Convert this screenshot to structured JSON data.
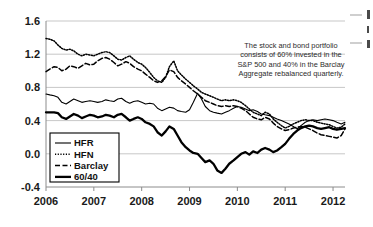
{
  "figure": {
    "title": "",
    "annotation": [
      "The stock and bond portfolio",
      "consists of 60% invested in the",
      "S&P 500 and 40% in the Barclay",
      "Aggregate rebalanced quarterly."
    ]
  },
  "chart_data": {
    "type": "line",
    "title": "",
    "xlabel": "",
    "ylabel": "",
    "xlim": [
      2006.0,
      2012.25
    ],
    "ylim": [
      -0.4,
      1.6
    ],
    "yticks": [
      "-0.4",
      "0.0",
      "0.4",
      "0.8",
      "1.2",
      "1.6"
    ],
    "ytick_values": [
      -0.4,
      0.0,
      0.4,
      0.8,
      1.2,
      1.6
    ],
    "xticks": [
      "2006",
      "2007",
      "2008",
      "2009",
      "2010",
      "2011",
      "2012"
    ],
    "xtick_values": [
      2006,
      2007,
      2008,
      2009,
      2010,
      2011,
      2012
    ],
    "grid": true,
    "legend_position": "lower-left-inside",
    "annotations": [
      {
        "text": "The stock and bond portfolio consists of 60% invested in the S&P 500 and 40% in the Barclay Aggregate rebalanced quarterly.",
        "x": 2009.6,
        "y": 1.3
      }
    ],
    "series": [
      {
        "name": "HFR",
        "style": "thin-solid",
        "color": "#000000",
        "x": [
          2006.0,
          2006.08,
          2006.17,
          2006.25,
          2006.33,
          2006.42,
          2006.5,
          2006.58,
          2006.67,
          2006.75,
          2006.83,
          2006.92,
          2007.0,
          2007.08,
          2007.17,
          2007.25,
          2007.33,
          2007.42,
          2007.5,
          2007.58,
          2007.67,
          2007.75,
          2007.83,
          2007.92,
          2008.0,
          2008.08,
          2008.17,
          2008.25,
          2008.33,
          2008.42,
          2008.5,
          2008.58,
          2008.67,
          2008.75,
          2008.83,
          2008.92,
          2009.0,
          2009.08,
          2009.17,
          2009.25,
          2009.33,
          2009.42,
          2009.5,
          2009.58,
          2009.67,
          2009.75,
          2009.83,
          2009.92,
          2010.0,
          2010.08,
          2010.17,
          2010.25,
          2010.33,
          2010.42,
          2010.5,
          2010.58,
          2010.67,
          2010.75,
          2010.83,
          2010.92,
          2011.0,
          2011.08,
          2011.17,
          2011.25,
          2011.33,
          2011.42,
          2011.5,
          2011.58,
          2011.67,
          2011.75,
          2011.83,
          2011.92,
          2012.0,
          2012.08,
          2012.17,
          2012.25
        ],
        "values": [
          0.72,
          0.71,
          0.7,
          0.68,
          0.62,
          0.6,
          0.63,
          0.66,
          0.64,
          0.62,
          0.63,
          0.64,
          0.63,
          0.62,
          0.63,
          0.65,
          0.64,
          0.63,
          0.66,
          0.67,
          0.63,
          0.61,
          0.63,
          0.64,
          0.62,
          0.6,
          0.61,
          0.6,
          0.55,
          0.52,
          0.54,
          0.56,
          0.55,
          0.52,
          0.51,
          0.5,
          0.53,
          0.62,
          0.73,
          0.66,
          0.57,
          0.52,
          0.5,
          0.49,
          0.48,
          0.5,
          0.52,
          0.55,
          0.57,
          0.56,
          0.54,
          0.52,
          0.53,
          0.51,
          0.48,
          0.47,
          0.46,
          0.44,
          0.42,
          0.4,
          0.38,
          0.36,
          0.33,
          0.3,
          0.34,
          0.38,
          0.4,
          0.41,
          0.4,
          0.41,
          0.42,
          0.41,
          0.4,
          0.38,
          0.36,
          0.38
        ]
      },
      {
        "name": "HFN",
        "style": "dotted",
        "color": "#000000",
        "x": [
          2006.0,
          2006.08,
          2006.17,
          2006.25,
          2006.33,
          2006.42,
          2006.5,
          2006.58,
          2006.67,
          2006.75,
          2006.83,
          2006.92,
          2007.0,
          2007.08,
          2007.17,
          2007.25,
          2007.33,
          2007.42,
          2007.5,
          2007.58,
          2007.67,
          2007.75,
          2007.83,
          2007.92,
          2008.0,
          2008.08,
          2008.17,
          2008.25,
          2008.33,
          2008.42,
          2008.5,
          2008.58,
          2008.67,
          2008.75,
          2008.83,
          2008.92,
          2009.0,
          2009.08,
          2009.17,
          2009.25,
          2009.33,
          2009.42,
          2009.5,
          2009.58,
          2009.67,
          2009.75,
          2009.83,
          2009.92,
          2010.0,
          2010.08,
          2010.17,
          2010.25,
          2010.33,
          2010.42,
          2010.5,
          2010.58,
          2010.67,
          2010.75,
          2010.83,
          2010.92,
          2011.0,
          2011.08,
          2011.17,
          2011.25,
          2011.33,
          2011.42,
          2011.5,
          2011.58,
          2011.67,
          2011.75,
          2011.83,
          2011.92,
          2012.0,
          2012.08,
          2012.17,
          2012.25
        ],
        "values": [
          1.39,
          1.38,
          1.36,
          1.31,
          1.27,
          1.25,
          1.26,
          1.24,
          1.2,
          1.18,
          1.2,
          1.19,
          1.18,
          1.2,
          1.22,
          1.23,
          1.22,
          1.18,
          1.14,
          1.13,
          1.16,
          1.18,
          1.14,
          1.1,
          1.08,
          1.04,
          0.98,
          0.92,
          0.88,
          0.86,
          0.92,
          1.05,
          1.12,
          1.0,
          0.95,
          0.9,
          0.86,
          0.82,
          0.78,
          0.74,
          0.72,
          0.7,
          0.68,
          0.66,
          0.64,
          0.65,
          0.64,
          0.65,
          0.64,
          0.62,
          0.58,
          0.54,
          0.5,
          0.48,
          0.46,
          0.5,
          0.48,
          0.42,
          0.38,
          0.34,
          0.31,
          0.33,
          0.36,
          0.38,
          0.4,
          0.41,
          0.4,
          0.4,
          0.38,
          0.37,
          0.36,
          0.35,
          0.33,
          0.31,
          0.32,
          0.36
        ]
      },
      {
        "name": "Barclay",
        "style": "dashed",
        "color": "#000000",
        "x": [
          2006.0,
          2006.08,
          2006.17,
          2006.25,
          2006.33,
          2006.42,
          2006.5,
          2006.58,
          2006.67,
          2006.75,
          2006.83,
          2006.92,
          2007.0,
          2007.08,
          2007.17,
          2007.25,
          2007.33,
          2007.42,
          2007.5,
          2007.58,
          2007.67,
          2007.75,
          2007.83,
          2007.92,
          2008.0,
          2008.08,
          2008.17,
          2008.25,
          2008.33,
          2008.42,
          2008.5,
          2008.58,
          2008.67,
          2008.75,
          2008.83,
          2008.92,
          2009.0,
          2009.08,
          2009.17,
          2009.25,
          2009.33,
          2009.42,
          2009.5,
          2009.58,
          2009.67,
          2009.75,
          2009.83,
          2009.92,
          2010.0,
          2010.08,
          2010.17,
          2010.25,
          2010.33,
          2010.42,
          2010.5,
          2010.58,
          2010.67,
          2010.75,
          2010.83,
          2010.92,
          2011.0,
          2011.08,
          2011.17,
          2011.25,
          2011.33,
          2011.42,
          2011.5,
          2011.58,
          2011.67,
          2011.75,
          2011.83,
          2011.92,
          2012.0,
          2012.08,
          2012.17,
          2012.25
        ],
        "values": [
          0.99,
          1.02,
          1.05,
          1.04,
          1.0,
          1.02,
          1.06,
          1.05,
          1.03,
          1.06,
          1.09,
          1.07,
          1.08,
          1.12,
          1.15,
          1.16,
          1.14,
          1.1,
          1.06,
          1.08,
          1.11,
          1.09,
          1.05,
          1.02,
          1.0,
          0.96,
          0.92,
          0.88,
          0.86,
          0.88,
          0.93,
          1.01,
          0.99,
          0.92,
          0.88,
          0.84,
          0.8,
          0.76,
          0.72,
          0.68,
          0.64,
          0.62,
          0.6,
          0.58,
          0.57,
          0.58,
          0.57,
          0.58,
          0.57,
          0.55,
          0.52,
          0.48,
          0.44,
          0.42,
          0.41,
          0.44,
          0.42,
          0.37,
          0.33,
          0.3,
          0.28,
          0.29,
          0.31,
          0.32,
          0.33,
          0.32,
          0.3,
          0.28,
          0.25,
          0.23,
          0.22,
          0.21,
          0.2,
          0.19,
          0.22,
          0.3
        ]
      },
      {
        "name": "60/40",
        "style": "thick-solid",
        "color": "#000000",
        "x": [
          2006.0,
          2006.08,
          2006.17,
          2006.25,
          2006.33,
          2006.42,
          2006.5,
          2006.58,
          2006.67,
          2006.75,
          2006.83,
          2006.92,
          2007.0,
          2007.08,
          2007.17,
          2007.25,
          2007.33,
          2007.42,
          2007.5,
          2007.58,
          2007.67,
          2007.75,
          2007.83,
          2007.92,
          2008.0,
          2008.08,
          2008.17,
          2008.25,
          2008.33,
          2008.42,
          2008.5,
          2008.58,
          2008.67,
          2008.75,
          2008.83,
          2008.92,
          2009.0,
          2009.08,
          2009.17,
          2009.25,
          2009.33,
          2009.42,
          2009.5,
          2009.58,
          2009.67,
          2009.75,
          2009.83,
          2009.92,
          2010.0,
          2010.08,
          2010.17,
          2010.25,
          2010.33,
          2010.42,
          2010.5,
          2010.58,
          2010.67,
          2010.75,
          2010.83,
          2010.92,
          2011.0,
          2011.08,
          2011.17,
          2011.25,
          2011.33,
          2011.42,
          2011.5,
          2011.58,
          2011.67,
          2011.75,
          2011.83,
          2011.92,
          2012.0,
          2012.08,
          2012.17,
          2012.25
        ],
        "values": [
          0.5,
          0.5,
          0.5,
          0.49,
          0.44,
          0.42,
          0.45,
          0.48,
          0.46,
          0.43,
          0.45,
          0.47,
          0.46,
          0.44,
          0.45,
          0.47,
          0.46,
          0.44,
          0.47,
          0.48,
          0.44,
          0.4,
          0.42,
          0.44,
          0.42,
          0.38,
          0.36,
          0.33,
          0.26,
          0.22,
          0.27,
          0.33,
          0.3,
          0.22,
          0.14,
          0.08,
          0.04,
          0.01,
          0.0,
          -0.05,
          -0.1,
          -0.08,
          -0.12,
          -0.2,
          -0.23,
          -0.18,
          -0.12,
          -0.08,
          -0.04,
          0.0,
          0.02,
          -0.01,
          0.03,
          0.01,
          0.05,
          0.07,
          0.05,
          0.02,
          0.04,
          0.08,
          0.12,
          0.18,
          0.24,
          0.28,
          0.31,
          0.33,
          0.34,
          0.33,
          0.31,
          0.3,
          0.31,
          0.32,
          0.3,
          0.29,
          0.3,
          0.31
        ]
      }
    ]
  },
  "legend": {
    "items": [
      {
        "label": "HFR",
        "style": "thin-solid"
      },
      {
        "label": "HFN",
        "style": "dotted"
      },
      {
        "label": "Barclay",
        "style": "dashed"
      },
      {
        "label": "60/40",
        "style": "thick-solid"
      }
    ]
  },
  "colors": {
    "background": "#ffffff",
    "ink": "#000000",
    "gridline": "#b9b9b9",
    "axis": "#8c8c8c",
    "annotation_text": "#2b2b2b"
  }
}
